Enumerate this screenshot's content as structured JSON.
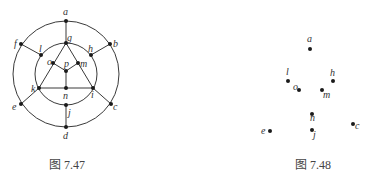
{
  "figures": [
    {
      "id": "fig-left",
      "caption": "图 7.47",
      "caption_pos": {
        "x": 49,
        "y": 155
      },
      "circles": [
        {
          "cx": 66,
          "cy": 74,
          "r": 53
        },
        {
          "cx": 66,
          "cy": 74,
          "r": 31
        }
      ],
      "vertices": [
        {
          "name": "a",
          "x": 66,
          "y": 21,
          "lx": 63,
          "ly": 15
        },
        {
          "name": "b",
          "x": 110,
          "y": 44,
          "lx": 113,
          "ly": 47
        },
        {
          "name": "c",
          "x": 111,
          "y": 104,
          "lx": 113,
          "ly": 110
        },
        {
          "name": "d",
          "x": 66,
          "y": 127,
          "lx": 63,
          "ly": 139
        },
        {
          "name": "e",
          "x": 21,
          "y": 104,
          "lx": 12,
          "ly": 110
        },
        {
          "name": "f",
          "x": 21,
          "y": 44,
          "lx": 14,
          "ly": 47
        },
        {
          "name": "g",
          "x": 66,
          "y": 43,
          "lx": 67,
          "ly": 41
        },
        {
          "name": "h",
          "x": 91,
          "y": 55,
          "lx": 88,
          "ly": 52
        },
        {
          "name": "i",
          "x": 93,
          "y": 88,
          "lx": 91,
          "ly": 98
        },
        {
          "name": "j",
          "x": 66,
          "y": 105,
          "lx": 68,
          "ly": 116
        },
        {
          "name": "k",
          "x": 39,
          "y": 88,
          "lx": 31,
          "ly": 92
        },
        {
          "name": "l",
          "x": 41,
          "y": 55,
          "lx": 39,
          "ly": 52
        },
        {
          "name": "m",
          "x": 78,
          "y": 63,
          "lx": 80,
          "ly": 67
        },
        {
          "name": "n",
          "x": 66,
          "y": 88,
          "lx": 63,
          "ly": 99
        },
        {
          "name": "o",
          "x": 53,
          "y": 63,
          "lx": 47,
          "ly": 65
        },
        {
          "name": "p",
          "x": 66,
          "y": 71,
          "lx": 64,
          "ly": 67
        }
      ],
      "edges": [
        [
          "a",
          "g"
        ],
        [
          "b",
          "h"
        ],
        [
          "c",
          "i"
        ],
        [
          "d",
          "j"
        ],
        [
          "e",
          "k"
        ],
        [
          "f",
          "l"
        ],
        [
          "g",
          "k"
        ],
        [
          "g",
          "i"
        ],
        [
          "k",
          "i"
        ],
        [
          "o",
          "p"
        ],
        [
          "m",
          "p"
        ],
        [
          "p",
          "n"
        ]
      ]
    },
    {
      "id": "fig-right",
      "caption": "图 7.48",
      "caption_pos": {
        "x": 295,
        "y": 155
      },
      "circles": [],
      "vertices": [
        {
          "name": "a",
          "x": 310,
          "y": 49,
          "lx": 307,
          "ly": 42
        },
        {
          "name": "l",
          "x": 288,
          "y": 81,
          "lx": 286,
          "ly": 75
        },
        {
          "name": "o",
          "x": 299,
          "y": 90,
          "lx": 293,
          "ly": 90
        },
        {
          "name": "h",
          "x": 333,
          "y": 81,
          "lx": 330,
          "ly": 76
        },
        {
          "name": "m",
          "x": 322,
          "y": 90,
          "lx": 323,
          "ly": 98
        },
        {
          "name": "n",
          "x": 312,
          "y": 114,
          "lx": 310,
          "ly": 121
        },
        {
          "name": "j",
          "x": 312,
          "y": 130,
          "lx": 313,
          "ly": 138
        },
        {
          "name": "e",
          "x": 270,
          "y": 131,
          "lx": 261,
          "ly": 134
        },
        {
          "name": "c",
          "x": 353,
          "y": 124,
          "lx": 355,
          "ly": 129
        }
      ],
      "edges": []
    }
  ]
}
